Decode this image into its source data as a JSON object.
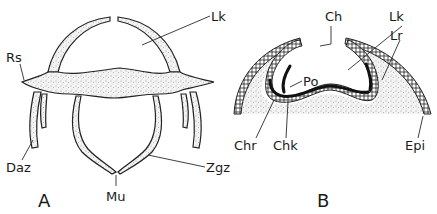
{
  "figure": {
    "panels": [
      {
        "id": "A",
        "label": "A",
        "annotations": [
          {
            "key": "Lk",
            "text": "Lk"
          },
          {
            "key": "Rs",
            "text": "Rs"
          },
          {
            "key": "Daz",
            "text": "Daz"
          },
          {
            "key": "Zgz",
            "text": "Zgz"
          },
          {
            "key": "Mu",
            "text": "Mu"
          }
        ]
      },
      {
        "id": "B",
        "label": "B",
        "annotations": [
          {
            "key": "Ch",
            "text": "Ch"
          },
          {
            "key": "Lk",
            "text": "Lk"
          },
          {
            "key": "Lr",
            "text": "Lr"
          },
          {
            "key": "Po",
            "text": "Po"
          },
          {
            "key": "Chr",
            "text": "Chr"
          },
          {
            "key": "Chk",
            "text": "Chk"
          },
          {
            "key": "Epi",
            "text": "Epi"
          }
        ]
      }
    ]
  }
}
